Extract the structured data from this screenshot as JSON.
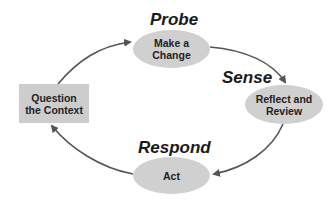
{
  "diagram": {
    "type": "cycle",
    "colors": {
      "node_fill": "#d0d0d0",
      "rect_fill": "#cdcdcd",
      "arrow": "#555555",
      "text": "#222222",
      "label": "#1a1a1a"
    },
    "phases": [
      {
        "id": "probe",
        "label": "Probe"
      },
      {
        "id": "sense",
        "label": "Sense"
      },
      {
        "id": "respond",
        "label": "Respond"
      }
    ],
    "nodes": [
      {
        "id": "make-a-change",
        "shape": "ellipse",
        "text": "Make a\nChange"
      },
      {
        "id": "reflect-and-review",
        "shape": "ellipse",
        "text": "Reflect and\nReview"
      },
      {
        "id": "act",
        "shape": "ellipse",
        "text": "Act"
      },
      {
        "id": "question-the-context",
        "shape": "rectangle",
        "text": "Question\nthe Context"
      }
    ],
    "edges": [
      {
        "from": "question-the-context",
        "to": "make-a-change"
      },
      {
        "from": "make-a-change",
        "to": "reflect-and-review"
      },
      {
        "from": "reflect-and-review",
        "to": "act"
      },
      {
        "from": "act",
        "to": "question-the-context"
      }
    ]
  }
}
